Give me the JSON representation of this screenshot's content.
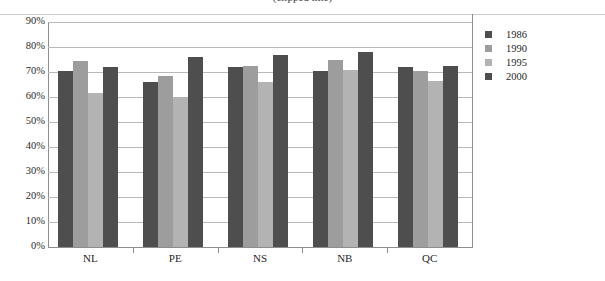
{
  "title": {
    "text": "(clipped title)",
    "visible": false
  },
  "legend": {
    "position": "right",
    "entries": [
      {
        "label": "1986",
        "color": "#4e4e4e"
      },
      {
        "label": "1990",
        "color": "#9d9d9d"
      },
      {
        "label": "1995",
        "color": "#b3b3b3"
      },
      {
        "label": "2000",
        "color": "#4e4e4e"
      }
    ]
  },
  "axis": {
    "y_ticks": [
      "0%",
      "10%",
      "20%",
      "30%",
      "40%",
      "50%",
      "60%",
      "70%",
      "80%",
      "90%"
    ],
    "x_ticks": [
      "NL",
      "PE",
      "NS",
      "NB",
      "QC"
    ]
  },
  "chart_data": {
    "type": "bar",
    "title": "",
    "subtitle": "",
    "xlabel": "",
    "ylabel": "",
    "categories": [
      "NL",
      "PE",
      "NS",
      "NB",
      "QC"
    ],
    "series": [
      {
        "name": "1986",
        "color": "#4e4e4e",
        "values": [
          70.5,
          66.0,
          72.0,
          70.5,
          72.0
        ]
      },
      {
        "name": "1990",
        "color": "#9d9d9d",
        "values": [
          74.5,
          68.5,
          72.5,
          75.0,
          70.5
        ]
      },
      {
        "name": "1995",
        "color": "#b3b3b3",
        "values": [
          61.5,
          60.0,
          66.0,
          71.0,
          66.5
        ]
      },
      {
        "name": "2000",
        "color": "#4e4e4e",
        "values": [
          72.0,
          76.0,
          77.0,
          78.0,
          72.5
        ]
      }
    ],
    "ylim": [
      0,
      90
    ],
    "ytick_step": 10,
    "ytick_format": "percent",
    "grid": true,
    "legend_position": "right"
  }
}
